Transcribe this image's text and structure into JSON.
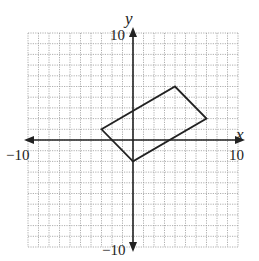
{
  "figure": {
    "type": "coordinate-plane",
    "x_axis_label": "x",
    "y_axis_label": "y",
    "x_min_label": "−10",
    "x_max_label": "10",
    "y_min_label": "−10",
    "y_max_label": "10",
    "grid_style": "dotted",
    "grid_color": "#9a9a9a",
    "axis_color": "#222222",
    "shape_color": "#222222"
  },
  "chart_data": {
    "type": "scatter",
    "title": "",
    "xlabel": "x",
    "ylabel": "y",
    "xlim": [
      -10,
      10
    ],
    "ylim": [
      -10,
      10
    ],
    "grid": true,
    "x_ticks_labeled": [
      -10,
      10
    ],
    "y_ticks_labeled": [
      -10,
      10
    ],
    "shape": "parallelogram",
    "vertices": [
      {
        "x": -3,
        "y": 1
      },
      {
        "x": 4,
        "y": 5
      },
      {
        "x": 7,
        "y": 2
      },
      {
        "x": 0,
        "y": -2
      }
    ]
  }
}
